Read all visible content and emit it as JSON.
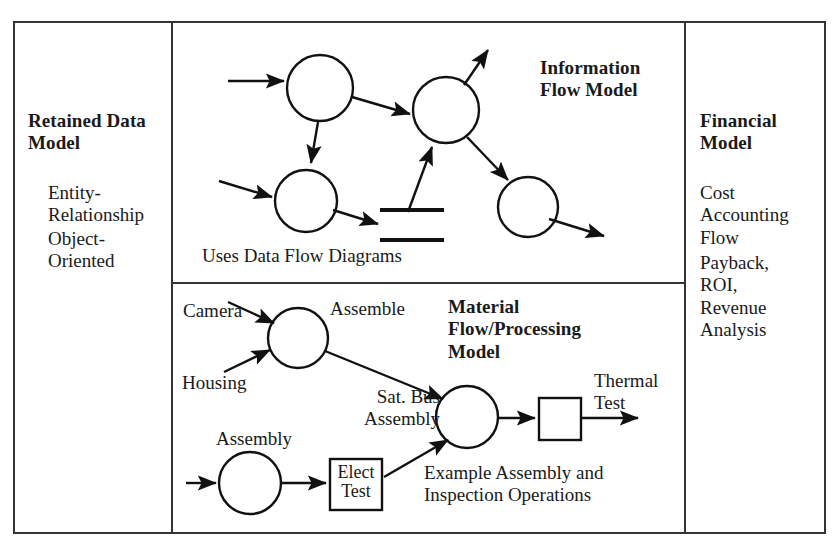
{
  "figure": {
    "type": "diagram"
  },
  "panels": {
    "left": {
      "title": "Retained Data\nModel",
      "items": [
        "Entity-\nRelationship",
        "Object-\nOriented"
      ]
    },
    "top_middle": {
      "title": "Information\nFlow Model",
      "caption": "Uses Data Flow Diagrams"
    },
    "bottom_middle": {
      "title": "Material\nFlow/Processing\nModel",
      "caption": "Example Assembly and\nInspection Operations",
      "labels": {
        "camera": "Camera",
        "housing": "Housing",
        "assemble": "Assemble",
        "sat_bus_assembly": "Sat. Bus\nAssembly",
        "assembly": "Assembly",
        "elect_test": "Elect\nTest",
        "thermal_test": "Thermal\nTest"
      }
    },
    "right": {
      "title": "Financial\nModel",
      "items": [
        "Cost\nAccounting\nFlow",
        "Payback,\nROI,\nRevenue\nAnalysis"
      ]
    }
  },
  "colors": {
    "ink": "#1a1a1a",
    "line": "#111111",
    "background": "#ffffff"
  },
  "geometry": {
    "frame": {
      "x": 14,
      "y": 22,
      "w": 811,
      "h": 511
    },
    "divider_left_x": 172,
    "divider_right_x": 685,
    "divider_mid_y": 283,
    "info_flow_nodes": [
      {
        "id": "n1",
        "cx": 320,
        "cy": 88,
        "r": 33
      },
      {
        "id": "n2",
        "cx": 446,
        "cy": 110,
        "r": 33
      },
      {
        "id": "n3",
        "cx": 306,
        "cy": 201,
        "r": 31
      },
      {
        "id": "n4",
        "cx": 528,
        "cy": 207,
        "r": 30
      }
    ],
    "datastore_bars": [
      {
        "x1": 380,
        "x2": 444,
        "y": 210
      },
      {
        "x1": 380,
        "x2": 444,
        "y": 240
      }
    ],
    "material_nodes": [
      {
        "id": "assemble",
        "cx": 298,
        "cy": 338,
        "r": 30
      },
      {
        "id": "integrate",
        "cx": 467,
        "cy": 417,
        "r": 31
      },
      {
        "id": "assembly",
        "cx": 250,
        "cy": 483,
        "r": 31
      }
    ],
    "material_boxes": [
      {
        "id": "thermal-test-box",
        "x": 539,
        "y": 398,
        "w": 42,
        "h": 42
      },
      {
        "id": "elect-test-box",
        "x": 330,
        "y": 459,
        "w": 52,
        "h": 51
      }
    ]
  }
}
